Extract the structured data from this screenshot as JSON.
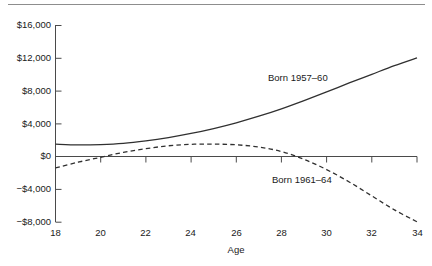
{
  "chart_data": {
    "type": "line",
    "title": "",
    "xlabel": "Age",
    "ylabel": "",
    "xlim": [
      18,
      34
    ],
    "ylim": [
      -8000,
      16000
    ],
    "grid": false,
    "legend_position": "inline-annotations",
    "x_ticks": [
      18,
      20,
      22,
      24,
      26,
      28,
      30,
      32,
      34
    ],
    "x_tick_labels": [
      "18",
      "20",
      "22",
      "24",
      "26",
      "28",
      "30",
      "32",
      "34"
    ],
    "y_ticks": [
      -8000,
      -4000,
      0,
      4000,
      8000,
      12000,
      16000
    ],
    "y_tick_labels": [
      "−$8,000",
      "−$4,000",
      "$0",
      "$4,000",
      "$8,000",
      "$12,000",
      "$16,000"
    ],
    "x": [
      18,
      19,
      20,
      21,
      22,
      23,
      24,
      25,
      26,
      27,
      28,
      29,
      30,
      31,
      32,
      33,
      34
    ],
    "series": [
      {
        "name": "Born 1957–60",
        "label": "Born 1957–60",
        "style": "solid",
        "color": "#303030",
        "values": [
          1500,
          1400,
          1450,
          1600,
          1900,
          2300,
          2800,
          3400,
          4100,
          4900,
          5800,
          6800,
          7850,
          8950,
          10000,
          11050,
          12000
        ]
      },
      {
        "name": "Born 1961–64",
        "label": "Born 1961–64",
        "style": "dashed",
        "color": "#303030",
        "values": [
          -1400,
          -700,
          -100,
          500,
          950,
          1300,
          1480,
          1500,
          1420,
          1150,
          600,
          -350,
          -1600,
          -3100,
          -4800,
          -6500,
          -7950
        ]
      }
    ],
    "annotations": [
      {
        "text": "Born 1957–60",
        "x_px": 268,
        "y_px": 78
      },
      {
        "text": "Born 1961–64",
        "x_px": 272,
        "y_px": 180
      }
    ]
  },
  "colors": {
    "axis": "#4a4a4a",
    "rule": "#8d8d8d",
    "text": "#1a1a1a",
    "line": "#303030"
  }
}
